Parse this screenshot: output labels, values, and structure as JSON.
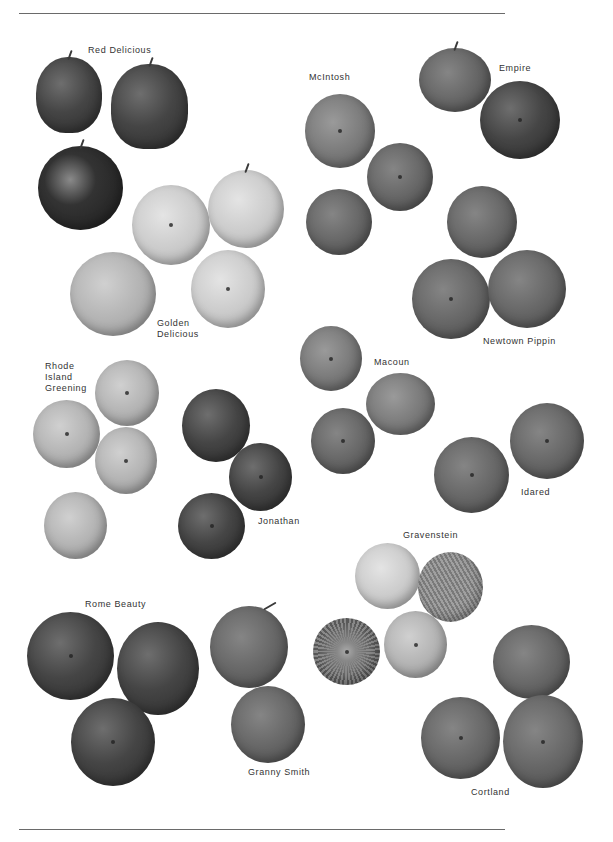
{
  "page": {
    "varieties": [
      {
        "name": "Red Delicious",
        "count": 3
      },
      {
        "name": "McIntosh",
        "count": 3
      },
      {
        "name": "Empire",
        "count": 2
      },
      {
        "name": "Golden Delicious",
        "count": 4
      },
      {
        "name": "Newtown Pippin",
        "count": 3
      },
      {
        "name": "Rhode Island Greening",
        "count": 4
      },
      {
        "name": "Macoun",
        "count": 3
      },
      {
        "name": "Jonathan",
        "count": 3
      },
      {
        "name": "Idared",
        "count": 2
      },
      {
        "name": "Gravenstein",
        "count": 4
      },
      {
        "name": "Rome Beauty",
        "count": 3
      },
      {
        "name": "Granny Smith",
        "count": 2
      },
      {
        "name": "Cortland",
        "count": 3
      }
    ]
  },
  "labels": {
    "red_delicious": "Red Delicious",
    "mcintosh": "McIntosh",
    "empire": "Empire",
    "golden_delicious": "Golden\nDelicious",
    "newtown_pippin": "Newtown Pippin",
    "rhode_island_greening": "Rhode\nIsland\nGreening",
    "macoun": "Macoun",
    "jonathan": "Jonathan",
    "idared": "Idared",
    "gravenstein": "Gravenstein",
    "rome_beauty": "Rome Beauty",
    "granny_smith": "Granny Smith",
    "cortland": "Cortland"
  }
}
